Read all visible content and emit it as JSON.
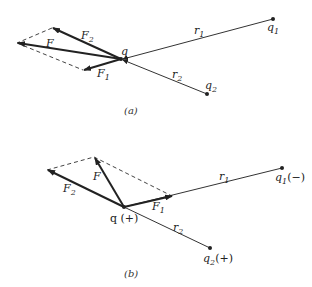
{
  "diagram_a": {
    "caption": "(a)",
    "labels": {
      "F": "F",
      "F1": "F",
      "F1_sub": "1",
      "F2": "F",
      "F2_sub": "2",
      "q": "q",
      "q1": "q",
      "q1_sub": "1",
      "q2": "q",
      "q2_sub": "2",
      "r1": "r",
      "r1_sub": "1",
      "r2": "r",
      "r2_sub": "2"
    }
  },
  "diagram_b": {
    "caption": "(b)",
    "labels": {
      "F": "F",
      "F1": "F",
      "F1_sub": "1",
      "F2": "F",
      "F2_sub": "2",
      "q": "q (+)",
      "q1": "q",
      "q1_sub": "1",
      "q1_sign": "(−)",
      "q2": "q",
      "q2_sub": "2",
      "q2_sign": "(+)",
      "r1": "r",
      "r1_sub": "1",
      "r2": "r",
      "r2_sub": "2"
    }
  },
  "colors": {
    "ink": "#222222",
    "dash": "#444444"
  }
}
